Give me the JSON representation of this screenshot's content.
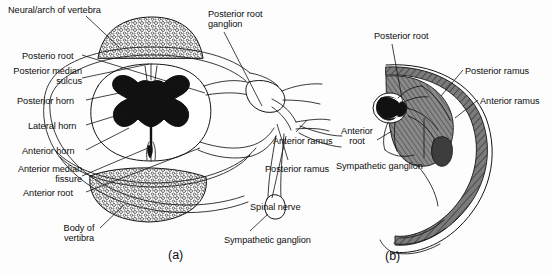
{
  "figure": {
    "background_color": "#fdfdfd",
    "ink_color": "#0d0d0d",
    "gray_fill": "#6f6f6f",
    "black_fill": "#111111",
    "captions": [
      {
        "id": "caption-a",
        "text": "(a)",
        "x": 168,
        "y": 248
      },
      {
        "id": "caption-b",
        "text": "(b)",
        "x": 385,
        "y": 249
      }
    ],
    "panel_a": {
      "labels": [
        {
          "id": "neural-arch-of-vertebra",
          "text": "Neural/arch of vertebra",
          "x": 8,
          "y": 5,
          "align": "left"
        },
        {
          "id": "posterio-root",
          "text": "Posterio root",
          "x": 22,
          "y": 51,
          "align": "left"
        },
        {
          "id": "posterior-median-sulcus",
          "text": "Posterior median\nsulcus",
          "x": 5,
          "y": 66,
          "align": "left"
        },
        {
          "id": "posterior-horn",
          "text": "Posterior horn",
          "x": 17,
          "y": 96,
          "align": "left"
        },
        {
          "id": "lateral-horn",
          "text": "Lateral horn",
          "x": 28,
          "y": 121,
          "align": "left"
        },
        {
          "id": "anterior-horn",
          "text": "Anterior horn",
          "x": 22,
          "y": 146,
          "align": "left"
        },
        {
          "id": "anterior-median-fissure",
          "text": "Anterior median\nfissure",
          "x": 10,
          "y": 164,
          "align": "left"
        },
        {
          "id": "anterior-root",
          "text": "Anterior root",
          "x": 23,
          "y": 188,
          "align": "left"
        },
        {
          "id": "body-of-vertibra",
          "text": "Body of\nvertibra",
          "x": 57,
          "y": 223,
          "align": "left"
        },
        {
          "id": "posterior-root-ganglion",
          "text": "Posterior root\nganglion",
          "x": 208,
          "y": 9,
          "align": "left"
        },
        {
          "id": "anterior-ramus",
          "text": "Anterior ramus",
          "x": 273,
          "y": 136,
          "align": "left"
        },
        {
          "id": "posterior-ramus",
          "text": "Posterior ramus",
          "x": 265,
          "y": 164,
          "align": "left"
        },
        {
          "id": "spinal-nerve",
          "text": "Spinal nerve",
          "x": 250,
          "y": 202,
          "align": "left"
        },
        {
          "id": "sympathetic-ganglion",
          "text": "Sympathetic ganglion",
          "x": 224,
          "y": 235,
          "align": "left"
        }
      ]
    },
    "panel_b": {
      "labels": [
        {
          "id": "b-posterior-root",
          "text": "Posterior root",
          "x": 374,
          "y": 31,
          "align": "left"
        },
        {
          "id": "b-posterior-ramus",
          "text": "Posterior ramus",
          "x": 465,
          "y": 66,
          "align": "left"
        },
        {
          "id": "b-anterior-ramus",
          "text": "Anterior ramus",
          "x": 480,
          "y": 96,
          "align": "left"
        },
        {
          "id": "b-anterior-root",
          "text": "Anterior\nroot",
          "x": 340,
          "y": 126,
          "align": "left"
        },
        {
          "id": "b-sympathetic-ganglion",
          "text": "Sympathetic ganglion",
          "x": 336,
          "y": 161,
          "align": "left"
        }
      ]
    }
  }
}
